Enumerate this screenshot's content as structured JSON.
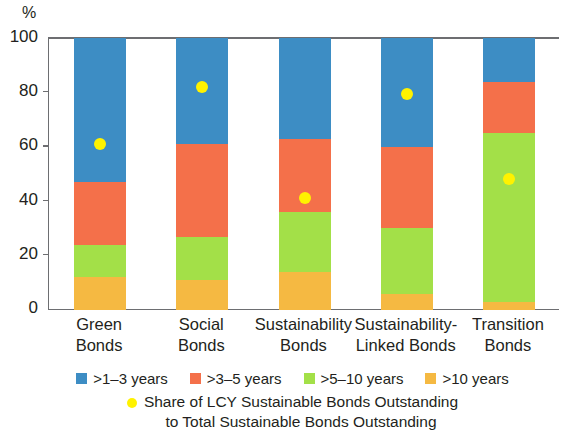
{
  "chart_data": {
    "type": "bar",
    "subtype": "stacked-bar-100-with-scatter-overlay",
    "title": "",
    "xlabel": "",
    "ylabel": "%",
    "ylim": [
      0,
      100
    ],
    "yticks": [
      0,
      20,
      40,
      60,
      80,
      100
    ],
    "ytick_labels": [
      "0",
      "20",
      "40",
      "60",
      "80",
      "100"
    ],
    "grid": false,
    "legend_position": "bottom",
    "categories": [
      "Green Bonds",
      "Social Bonds",
      "Sustainability Bonds",
      "Sustainability-Linked Bonds",
      "Transition Bonds"
    ],
    "category_lines": [
      [
        "Green",
        "Bonds"
      ],
      [
        "Social",
        "Bonds"
      ],
      [
        "Sustainability",
        "Bonds"
      ],
      [
        "Sustainability-",
        "Linked Bonds"
      ],
      [
        "Transition",
        "Bonds"
      ]
    ],
    "series": [
      {
        "name": ">1–3 years",
        "color": "#3d8dc4",
        "values": [
          53,
          39,
          37,
          40,
          16
        ]
      },
      {
        "name": ">3–5 years",
        "color": "#f4704a",
        "values": [
          23,
          34,
          27,
          30,
          19
        ]
      },
      {
        "name": ">5–10 years",
        "color": "#a3e048",
        "values": [
          12,
          16,
          22,
          24,
          62
        ]
      },
      {
        "name": ">10 years",
        "color": "#f5b942",
        "values": [
          12,
          11,
          14,
          6,
          3
        ]
      }
    ],
    "overlay": {
      "name": "Share of LCY Sustainable Bonds Outstanding to Total Sustainable Bonds Outstanding",
      "name_lines": [
        "Share of LCY Sustainable Bonds Outstanding",
        "to Total Sustainable Bonds Outstanding"
      ],
      "marker": "circle",
      "color": "#fff200",
      "values": [
        61,
        82,
        41,
        79.5,
        48
      ]
    }
  },
  "legend": {
    "items": [
      {
        "label": ">1–3 years",
        "color": "#3d8dc4"
      },
      {
        "label": ">3–5 years",
        "color": "#f4704a"
      },
      {
        "label": ">5–10 years",
        "color": "#a3e048"
      },
      {
        "label": ">10 years",
        "color": "#f5b942"
      }
    ]
  }
}
